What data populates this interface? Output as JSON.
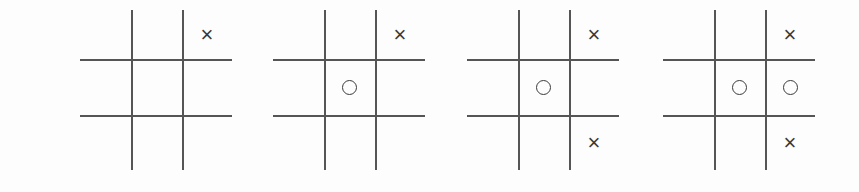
{
  "scene": {
    "title": "Tic-tac-toe game progression",
    "description": "Four tic-tac-toe boards shown left to right depicting successive moves",
    "background_color": "#fdfdfd",
    "line_color": "#555555",
    "mark_color": "#3a3a3a",
    "board_count": 4
  },
  "glyphs": {
    "x": "×",
    "o": "",
    "empty": ""
  },
  "boards": [
    {
      "name": "board-1",
      "left": 80,
      "cells": [
        {
          "row": 0,
          "col": 0,
          "mark": "empty"
        },
        {
          "row": 0,
          "col": 1,
          "mark": "empty"
        },
        {
          "row": 0,
          "col": 2,
          "mark": "x"
        },
        {
          "row": 1,
          "col": 0,
          "mark": "empty"
        },
        {
          "row": 1,
          "col": 1,
          "mark": "empty"
        },
        {
          "row": 1,
          "col": 2,
          "mark": "empty"
        },
        {
          "row": 2,
          "col": 0,
          "mark": "empty"
        },
        {
          "row": 2,
          "col": 1,
          "mark": "empty"
        },
        {
          "row": 2,
          "col": 2,
          "mark": "empty"
        }
      ]
    },
    {
      "name": "board-2",
      "left": 273,
      "cells": [
        {
          "row": 0,
          "col": 0,
          "mark": "empty"
        },
        {
          "row": 0,
          "col": 1,
          "mark": "empty"
        },
        {
          "row": 0,
          "col": 2,
          "mark": "x"
        },
        {
          "row": 1,
          "col": 0,
          "mark": "empty"
        },
        {
          "row": 1,
          "col": 1,
          "mark": "o"
        },
        {
          "row": 1,
          "col": 2,
          "mark": "empty"
        },
        {
          "row": 2,
          "col": 0,
          "mark": "empty"
        },
        {
          "row": 2,
          "col": 1,
          "mark": "empty"
        },
        {
          "row": 2,
          "col": 2,
          "mark": "empty"
        }
      ]
    },
    {
      "name": "board-3",
      "left": 467,
      "cells": [
        {
          "row": 0,
          "col": 0,
          "mark": "empty"
        },
        {
          "row": 0,
          "col": 1,
          "mark": "empty"
        },
        {
          "row": 0,
          "col": 2,
          "mark": "x"
        },
        {
          "row": 1,
          "col": 0,
          "mark": "empty"
        },
        {
          "row": 1,
          "col": 1,
          "mark": "o"
        },
        {
          "row": 1,
          "col": 2,
          "mark": "empty"
        },
        {
          "row": 2,
          "col": 0,
          "mark": "empty"
        },
        {
          "row": 2,
          "col": 1,
          "mark": "empty"
        },
        {
          "row": 2,
          "col": 2,
          "mark": "x"
        }
      ]
    },
    {
      "name": "board-4",
      "left": 663,
      "cells": [
        {
          "row": 0,
          "col": 0,
          "mark": "empty"
        },
        {
          "row": 0,
          "col": 1,
          "mark": "empty"
        },
        {
          "row": 0,
          "col": 2,
          "mark": "x"
        },
        {
          "row": 1,
          "col": 0,
          "mark": "empty"
        },
        {
          "row": 1,
          "col": 1,
          "mark": "o"
        },
        {
          "row": 1,
          "col": 2,
          "mark": "o"
        },
        {
          "row": 2,
          "col": 0,
          "mark": "empty"
        },
        {
          "row": 2,
          "col": 1,
          "mark": "empty"
        },
        {
          "row": 2,
          "col": 2,
          "mark": "x"
        }
      ]
    }
  ]
}
